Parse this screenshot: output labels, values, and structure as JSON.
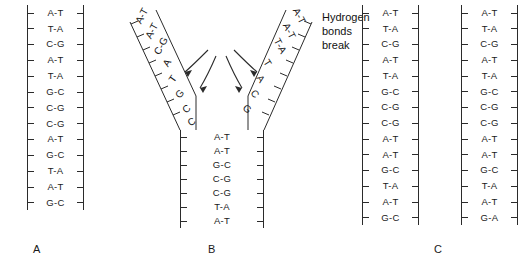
{
  "figure": {
    "annotation": {
      "text": "Hydrogen bonds break",
      "line1": "Hydrogen",
      "line2": "bonds",
      "line3": "break",
      "arrow_count": 4
    },
    "colors": {
      "ink": "#2b2b2b",
      "text": "#1a1a1a",
      "background": "#ffffff"
    }
  },
  "panels": [
    {
      "id": "A",
      "label": "A",
      "caption": "Intact parental DNA double helix",
      "base_pairs": [
        "A-T",
        "T-A",
        "C-G",
        "A-T",
        "T-A",
        "G-C",
        "C-G",
        "C-G",
        "A-T",
        "G-C",
        "T-A",
        "A-T",
        "G-C"
      ]
    },
    {
      "id": "B",
      "label": "B",
      "caption": "DNA unwinding at the replication fork",
      "left_arm": {
        "paired": [
          "A-T",
          "A-T",
          "C-G"
        ],
        "unpaired": [
          "A",
          "T",
          "G",
          "C",
          "C"
        ]
      },
      "right_arm": {
        "paired": [
          "A-T",
          "A-T",
          "T-A"
        ],
        "unpaired": [
          "T",
          "A",
          "C",
          "G"
        ]
      },
      "stem": [
        "A-T",
        "A-T",
        "G-C",
        "C-G",
        "C-G",
        "T-A",
        "A-T"
      ]
    },
    {
      "id": "C",
      "label": "C",
      "caption": "Two daughter DNA molecules",
      "helix_left": {
        "base_pairs": [
          "A-T",
          "T-A",
          "C-G",
          "A-T",
          "T-A",
          "G-C",
          "C-G",
          "C-G",
          "A-T",
          "A-T",
          "G-C",
          "T-A",
          "A-T",
          "G-C"
        ]
      },
      "helix_right": {
        "base_pairs": [
          "A-T",
          "T-A",
          "C-G",
          "A-T",
          "T-A",
          "G-C",
          "C-G",
          "C-G",
          "A-T",
          "A-T",
          "G-C",
          "T-A",
          "A-T",
          "G-A"
        ]
      }
    }
  ]
}
